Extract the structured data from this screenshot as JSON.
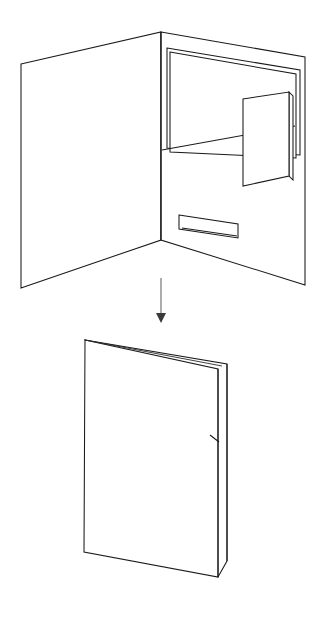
{
  "figure": {
    "caption": "Line drawing showing an open three-panel folder with inner pocket, business card slot and a pen loop slit, transforming into the closed folded folder below.",
    "background_color": "#ffffff",
    "line_color": "#1a1a1a",
    "arrow_color": "#808080",
    "view": "two-step isometric line diagram",
    "steps": [
      "open-folder",
      "closed-folder"
    ]
  },
  "open_folder": {
    "name": "Open folder, inside view",
    "left_panel": {
      "label": "Left cover panel",
      "points": "21,64 161,32 161,240 21,288"
    },
    "right_panel": {
      "label": "Right panel with pocket",
      "points": "161,32 305,57 305,285 161,240"
    },
    "spine": {
      "label": "Centre fold / spine",
      "points": "161,32 161,240"
    },
    "pocket_back": {
      "label": "Pocket back wall",
      "points": "167,48 300,70 300,155 167,148"
    },
    "pocket_front": {
      "label": "Pocket front flap",
      "points": "170,52 296,74 296,158 170,152"
    },
    "pocket_fold": {
      "label": "Pocket lower fold edge",
      "points": "162,150 295,126"
    },
    "card": {
      "label": "Business card in card slot",
      "points": "243,99 289,92 289,176 243,186"
    },
    "card_shadow": {
      "label": "Card slot right edge",
      "points": "289,92 293,96 293,180 289,176"
    },
    "pen_slot": {
      "label": "Pen loop slit",
      "points": "179,215 238,224 238,238 179,229"
    },
    "pen_slot_inner": {
      "label": "Pen loop slit inner edge",
      "points": "182,228 237,236"
    }
  },
  "transition_arrow": {
    "name": "Transformation arrow (fold down)",
    "direction": "down",
    "shaft": "161,278 161,314",
    "head": "156,313 166,313 161,323"
  },
  "closed_folder": {
    "name": "Closed folder, front view",
    "front_cover": {
      "label": "Front cover face",
      "points": "85,340 218,369 218,577 84,552"
    },
    "back_cover": {
      "label": "Back cover edge visible behind",
      "points": "85,340 227,364 227,561 218,577"
    },
    "spine_edge": {
      "label": "Folded spine edge",
      "points": "218,369 218,577"
    },
    "back_edge": {
      "label": "Back panel outer edge",
      "points": "227,364 227,561"
    },
    "notch": {
      "label": "Pocket step notch on spine",
      "points": "210,435 219,442"
    },
    "top_crease": {
      "label": "Top crease line",
      "points": "85,340 222,366"
    }
  }
}
